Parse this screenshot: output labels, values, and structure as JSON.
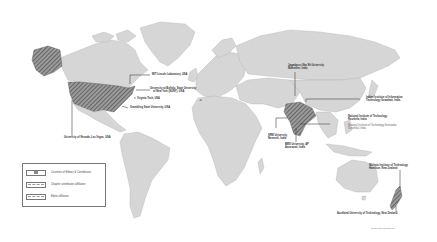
{
  "map": {
    "type": "world-map",
    "highlighted_countries": [
      "United States",
      "India"
    ],
    "colors": {
      "land": "#d6d6d6",
      "borders": "#b4b4b4",
      "hatched": "#666666",
      "leader_lines": "#444444",
      "background": "#ffffff"
    }
  },
  "labels": {
    "mit_lincoln": "MIT Lincoln Laboratory, USA",
    "buffalo_1": "University at Buffalo, State University",
    "buffalo_2": "of New York (SUNY), USA",
    "virginia_tech": "Virginia Tech, USA",
    "grambling": "Grambling State University, USA",
    "nevada": "University of Nevada, Las Vegas, USA",
    "jagadguru_1": "Jagadguru Sha Sh University",
    "jagadguru_2": "Mahaneer, India",
    "iiit_1": "Indian Institute of Information",
    "iiit_2": "Technology Guwahati, India",
    "nit_1": "National Institute of Technology",
    "nit_2": "Rourkela, India",
    "nit_ko_1": "National Institute of Technology Karnataka",
    "nit_ko_2": "Surathkal, India",
    "srm_1": "SRM University,",
    "srm_2": "Nemmeli, India",
    "bms_1": "BMS University, AP",
    "bms_2": "Amaravati, India",
    "waikato_1": "Waikato Institute of Technology",
    "waikato_2": "Hamilton, New Zealand",
    "aut": "Auckland University of Technology, New Zealand"
  },
  "legend": {
    "items": [
      {
        "label": "Countries of Editors & Contributors",
        "swatch": "hatched-box"
      },
      {
        "label": "Chapter contributors affiliation",
        "swatch": "dashed-line"
      },
      {
        "label": "Editor affiliation",
        "swatch": "dashed-line"
      }
    ]
  },
  "credit": "Created with mapchart.net"
}
